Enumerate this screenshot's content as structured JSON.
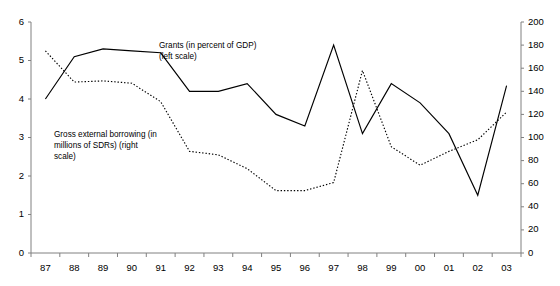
{
  "chart_data": {
    "type": "line",
    "title": "",
    "subtitle": "",
    "xlabel": "",
    "ylabel": "",
    "grid": false,
    "legend_position": "inline-annotation",
    "categories": [
      "87",
      "88",
      "89",
      "90",
      "91",
      "92",
      "93",
      "94",
      "95",
      "96",
      "97",
      "98",
      "99",
      "00",
      "01",
      "02",
      "03"
    ],
    "axes": {
      "left": {
        "label": "Grants (in percent of GDP)",
        "ylim": [
          0,
          6
        ],
        "ticks": [
          0,
          1,
          2,
          3,
          4,
          5,
          6
        ],
        "tick_labels": [
          "0",
          "1",
          "2",
          "3",
          "4",
          "5",
          "6"
        ]
      },
      "right": {
        "label": "Gross external borrowing (in millions of SDRs)",
        "ylim": [
          0,
          200
        ],
        "ticks": [
          0,
          20,
          40,
          60,
          80,
          100,
          120,
          140,
          160,
          180,
          200
        ],
        "tick_labels": [
          "0",
          "20",
          "40",
          "60",
          "80",
          "100",
          "120",
          "140",
          "160",
          "180",
          "200"
        ]
      }
    },
    "series": [
      {
        "name": "Grants (in percent of GDP) (left scale)",
        "axis": "left",
        "style": "solid",
        "color": "#000000",
        "units": "percent of GDP",
        "values": [
          4.0,
          5.1,
          5.3,
          5.25,
          5.2,
          4.2,
          4.2,
          4.4,
          3.6,
          3.3,
          5.4,
          3.1,
          4.4,
          3.9,
          3.1,
          1.5,
          4.35
        ]
      },
      {
        "name": "Gross external borrowing (in millions of SDRs) (right scale)",
        "axis": "right",
        "style": "dotted",
        "color": "#000000",
        "units": "millions of SDRs",
        "values": [
          175,
          148,
          149,
          147,
          131,
          88,
          85,
          73,
          54,
          54,
          61,
          158,
          92,
          76,
          88,
          98,
          122
        ]
      }
    ],
    "annotations": [
      {
        "id": "grants",
        "text": "Grants (in percent of GDP)\n(left scale)"
      },
      {
        "id": "borrowing",
        "text": "Gross external borrowing (in\nmillions of SDRs) (right\nscale)"
      }
    ]
  },
  "annotations": {
    "grants": "Grants (in percent of GDP)\n(left scale)",
    "borrowing": "Gross external borrowing (in\nmillions of SDRs) (right\nscale)"
  },
  "colors": {
    "axis": "#808080",
    "line": "#000000",
    "background": "#ffffff"
  }
}
